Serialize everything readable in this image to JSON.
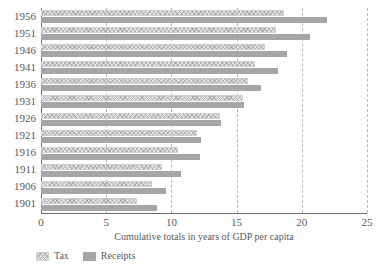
{
  "chart_data": {
    "type": "bar",
    "orientation": "horizontal",
    "title": "",
    "xlabel": "Cumulative totals in years of GDP per capita",
    "ylabel": "",
    "xlim": [
      0,
      25
    ],
    "xticks": [
      "0",
      "5",
      "10",
      "15",
      "20",
      "25"
    ],
    "xtick_values": [
      0,
      5,
      10,
      15,
      20,
      25
    ],
    "grid": "vertical-dashed",
    "legend_position": "bottom-left",
    "categories": [
      "1956",
      "1951",
      "1946",
      "1941",
      "1936",
      "1931",
      "1926",
      "1921",
      "1916",
      "1911",
      "1906",
      "1901"
    ],
    "series": [
      {
        "name": "Tax",
        "color": "#e3e3e3",
        "pattern": "checkered-hatch",
        "values": [
          18.6,
          18.0,
          17.2,
          16.4,
          15.9,
          15.5,
          13.7,
          12.0,
          10.5,
          9.3,
          8.5,
          7.4
        ]
      },
      {
        "name": "Receipts",
        "color": "#a6a6a8",
        "pattern": "solid",
        "values": [
          21.9,
          20.6,
          18.9,
          18.2,
          16.9,
          15.6,
          13.8,
          12.3,
          12.2,
          10.7,
          9.6,
          8.9
        ]
      }
    ]
  },
  "legend": {
    "items": [
      {
        "label": "Tax",
        "swatch": "tax-swatch"
      },
      {
        "label": "Receipts",
        "swatch": "receipts-swatch"
      }
    ]
  }
}
